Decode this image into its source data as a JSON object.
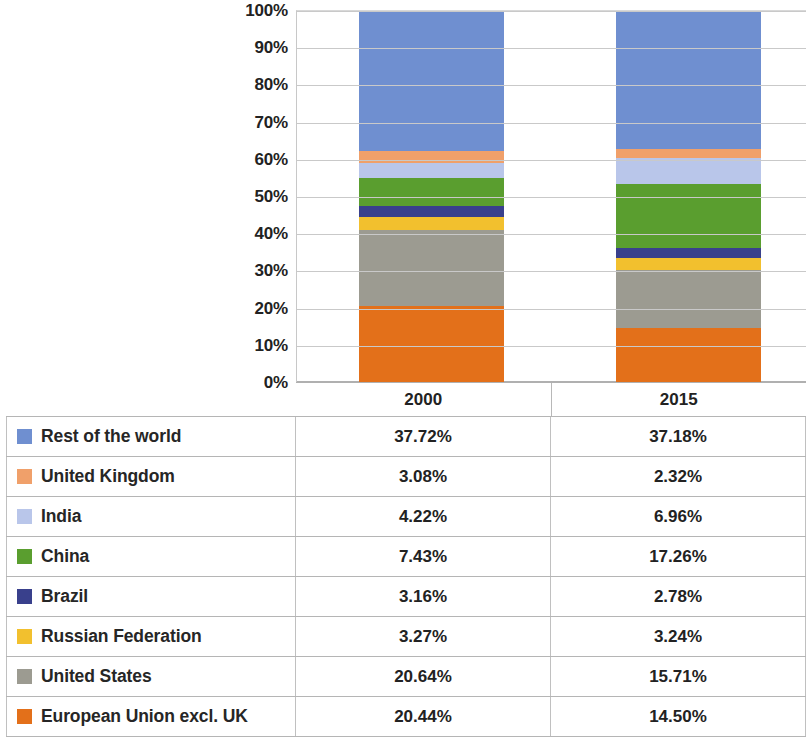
{
  "chart_data": {
    "type": "bar",
    "subtype": "stacked-100-percent",
    "title": "",
    "xlabel": "",
    "ylabel": "",
    "categories": [
      "2000",
      "2015"
    ],
    "ylim": [
      0,
      100
    ],
    "ytick_labels": [
      "0%",
      "10%",
      "20%",
      "30%",
      "40%",
      "50%",
      "60%",
      "70%",
      "80%",
      "90%",
      "100%"
    ],
    "ytick_values": [
      0,
      10,
      20,
      30,
      40,
      50,
      60,
      70,
      80,
      90,
      100
    ],
    "grid": true,
    "legend_position": "table-below",
    "stack_order_bottom_to_top": [
      "European Union excl. UK",
      "United States",
      "Russian Federation",
      "Brazil",
      "China",
      "India",
      "United Kingdom",
      "Rest of the world"
    ],
    "series": [
      {
        "name": "Rest of the world",
        "color": "#6f8fd0",
        "values": [
          37.72,
          37.18
        ],
        "labels": [
          "37.72%",
          "37.18%"
        ]
      },
      {
        "name": "United Kingdom",
        "color": "#f0a06a",
        "values": [
          3.08,
          2.32
        ],
        "labels": [
          "3.08%",
          "2.32%"
        ]
      },
      {
        "name": "India",
        "color": "#b9c6ea",
        "values": [
          4.22,
          6.96
        ],
        "labels": [
          "4.22%",
          "6.96%"
        ]
      },
      {
        "name": "China",
        "color": "#5a9e2f",
        "values": [
          7.43,
          17.26
        ],
        "labels": [
          "7.43%",
          "17.26%"
        ]
      },
      {
        "name": "Brazil",
        "color": "#39408c",
        "values": [
          3.16,
          2.78
        ],
        "labels": [
          "3.16%",
          "2.78%"
        ]
      },
      {
        "name": "Russian Federation",
        "color": "#f2c02e",
        "values": [
          3.27,
          3.24
        ],
        "labels": [
          "3.27%",
          "3.24%"
        ]
      },
      {
        "name": "United States",
        "color": "#9c9b91",
        "values": [
          20.64,
          15.71
        ],
        "labels": [
          "20.64%",
          "15.71%"
        ]
      },
      {
        "name": "European Union excl. UK",
        "color": "#e3701a",
        "values": [
          20.44,
          14.5
        ],
        "labels": [
          "20.44%",
          "14.50%"
        ]
      }
    ]
  },
  "table": {
    "column_headers": [
      "",
      "2000",
      "2015"
    ],
    "rows": [
      {
        "label": "Rest of the world",
        "color": "#6f8fd0",
        "v2000": "37.72%",
        "v2015": "37.18%"
      },
      {
        "label": "United Kingdom",
        "color": "#f0a06a",
        "v2000": "3.08%",
        "v2015": "2.32%"
      },
      {
        "label": "India",
        "color": "#b9c6ea",
        "v2000": "4.22%",
        "v2015": "6.96%"
      },
      {
        "label": "China",
        "color": "#5a9e2f",
        "v2000": "7.43%",
        "v2015": "17.26%"
      },
      {
        "label": "Brazil",
        "color": "#39408c",
        "v2000": "3.16%",
        "v2015": "2.78%"
      },
      {
        "label": "Russian Federation",
        "color": "#f2c02e",
        "v2000": "3.27%",
        "v2015": "3.24%"
      },
      {
        "label": "United States",
        "color": "#9c9b91",
        "v2000": "20.64%",
        "v2015": "15.71%"
      },
      {
        "label": "European Union excl. UK",
        "color": "#e3701a",
        "v2000": "20.44%",
        "v2015": "14.50%"
      }
    ]
  }
}
